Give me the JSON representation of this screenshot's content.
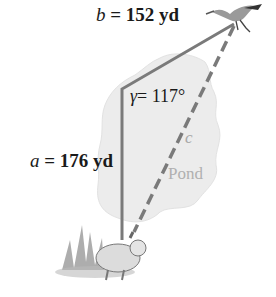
{
  "figure": {
    "side_b": {
      "var": "b",
      "text": " = 152 yd"
    },
    "side_a": {
      "var": "a",
      "text": " = 176 yd"
    },
    "angle": {
      "var": "γ",
      "text": "= 117°"
    },
    "side_c": {
      "var": "c"
    },
    "pond_label": "Pond",
    "colors": {
      "line": "#7a7a7a",
      "pond": "#ececec",
      "text": "#1a1a1a"
    }
  }
}
